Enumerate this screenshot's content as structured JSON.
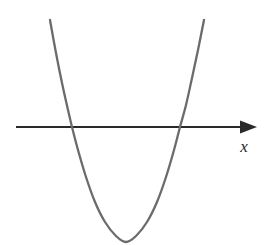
{
  "figure": {
    "name": "parabola-on-x-axis",
    "width": 270,
    "height": 245,
    "background_color": "#ffffff",
    "axis_label_x": "x"
  },
  "colors": {
    "axis": "#2a2a2a",
    "curve": "#6b6b6b",
    "label": "#1f1f1f",
    "background": "#ffffff"
  },
  "geometry": {
    "axis": {
      "y": 127,
      "x_start": 16,
      "x_end": 248,
      "stroke_width": 2.2,
      "arrow_tip_x": 257,
      "arrow_back_x": 240,
      "arrow_half_height": 6.5
    },
    "curve": {
      "stroke_width": 2.3,
      "left_top": [
        50,
        20
      ],
      "left_root": [
        72,
        127
      ],
      "vertex": [
        126,
        242
      ],
      "right_root": [
        180,
        127
      ],
      "right_top": [
        204,
        20
      ]
    },
    "label_position": {
      "x": 244,
      "y": 152
    }
  },
  "chart_data": {
    "type": "line",
    "title": "",
    "subtitle": "",
    "xlabel": "x",
    "ylabel": "",
    "grid": false,
    "legend": null,
    "annotations": [],
    "axis_shown": [
      "x"
    ],
    "curve_equation_form": "y = a(x - h)^2 + k, a > 0",
    "x_intercepts_pixels": [
      72,
      180
    ],
    "vertex_pixels": [
      126,
      242
    ],
    "axis_y_pixels": 127,
    "xlim": [
      16,
      257
    ],
    "ylim": [
      0,
      245
    ],
    "series": [
      {
        "name": "parabola",
        "color": "#6b6b6b",
        "points": [
          [
            50,
            20
          ],
          [
            56,
            53
          ],
          [
            62,
            83
          ],
          [
            68,
            110
          ],
          [
            72,
            127
          ],
          [
            78,
            150
          ],
          [
            86,
            177
          ],
          [
            95,
            202
          ],
          [
            105,
            222
          ],
          [
            116,
            236
          ],
          [
            126,
            242
          ],
          [
            136,
            236
          ],
          [
            147,
            222
          ],
          [
            157,
            202
          ],
          [
            166,
            177
          ],
          [
            174,
            150
          ],
          [
            180,
            127
          ],
          [
            186,
            105
          ],
          [
            192,
            78
          ],
          [
            198,
            50
          ],
          [
            204,
            20
          ]
        ]
      },
      {
        "name": "x-axis",
        "color": "#2a2a2a",
        "points": [
          [
            16,
            127
          ],
          [
            257,
            127
          ]
        ]
      }
    ]
  }
}
